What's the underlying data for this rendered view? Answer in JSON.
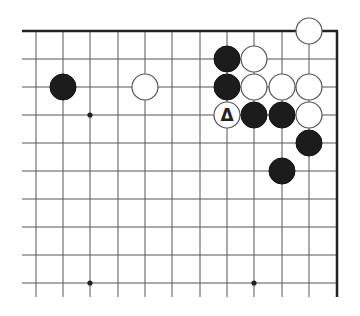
{
  "diagram": {
    "type": "go-board-fragment",
    "view": "top-right corner",
    "colors": {
      "background": "#ffffff",
      "grid": "#555555",
      "edge": "#222222",
      "black_stone": "#1c1c1c",
      "white_stone_fill": "#ffffff",
      "white_stone_stroke": "#555555",
      "marker": "#222222"
    },
    "grid": {
      "columns_x": [
        36,
        63,
        90,
        118,
        145,
        172,
        200,
        227,
        254,
        282,
        309
      ],
      "right_edge_x": 337,
      "rows_y": [
        31,
        59,
        87,
        115,
        143,
        171,
        199,
        227,
        255,
        283
      ],
      "left_extent_x": 22,
      "bottom_extent_y": 297,
      "top_edge": true,
      "right_edge": true
    },
    "star_points": [
      {
        "col": 2,
        "row": 3
      },
      {
        "col": 2,
        "row": 9
      },
      {
        "col": 8,
        "row": 9
      }
    ],
    "stones": [
      {
        "color": "black",
        "col": 1,
        "row": 2
      },
      {
        "color": "white",
        "col": 4,
        "row": 2
      },
      {
        "color": "white",
        "col": 10,
        "row": 0
      },
      {
        "color": "black",
        "col": 7,
        "row": 1
      },
      {
        "color": "white",
        "col": 8,
        "row": 1
      },
      {
        "color": "black",
        "col": 7,
        "row": 2
      },
      {
        "color": "white",
        "col": 8,
        "row": 2
      },
      {
        "color": "white",
        "col": 9,
        "row": 2
      },
      {
        "color": "white",
        "col": 10,
        "row": 2
      },
      {
        "color": "white",
        "col": 7,
        "row": 3,
        "marker": "triangle"
      },
      {
        "color": "black",
        "col": 8,
        "row": 3
      },
      {
        "color": "black",
        "col": 9,
        "row": 3
      },
      {
        "color": "white",
        "col": 10,
        "row": 3
      },
      {
        "color": "black",
        "col": 10,
        "row": 4
      },
      {
        "color": "black",
        "col": 9,
        "row": 5
      }
    ],
    "stone_radius": 13,
    "marker_label": "Δ"
  }
}
